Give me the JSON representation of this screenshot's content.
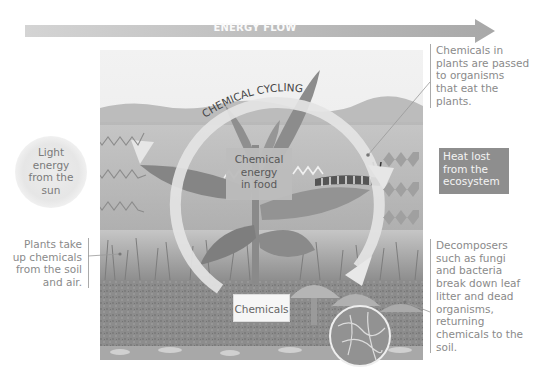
{
  "energy_flow": {
    "label": "ENERGY FLOW",
    "arrow_color": "#b8b8b8"
  },
  "chemical_cycling": {
    "label": "CHEMICAL CYCLING",
    "arrow_color": "#e2e2e2"
  },
  "sun": {
    "label_lines": [
      "Light",
      "energy",
      "from the",
      "sun"
    ],
    "label": "Light energy from the sun"
  },
  "boxes": {
    "chemical_energy": {
      "label_lines": [
        "Chemical",
        "energy",
        "in food"
      ],
      "label": "Chemical energy in food"
    },
    "chemicals": {
      "label": "Chemicals"
    },
    "heat_lost": {
      "label_lines": [
        "Heat lost",
        "from the",
        "ecosystem"
      ],
      "label": "Heat lost from the ecosystem",
      "color": "#8e8e8e"
    }
  },
  "annotations": {
    "plants_take_up": {
      "lines": [
        "Plants take",
        "up chemicals",
        "from the soil",
        "and air."
      ]
    },
    "chemicals_passed": {
      "lines": [
        "Chemicals in",
        "plants are passed",
        "to organisms",
        "that eat the",
        "plants."
      ]
    },
    "decomposers": {
      "lines": [
        "Decomposers",
        "such as fungi",
        "and bacteria",
        "break down leaf",
        "litter and dead",
        "organisms,",
        "returning",
        "chemicals to the",
        "soil."
      ]
    }
  },
  "icons": {
    "light_arrows": "zigzag-arrow-outline",
    "heat_arrows": "zigzag-arrow-filled",
    "caterpillar": "caterpillar",
    "mushrooms": "mushroom",
    "plant": "plant",
    "magnifier": "soil-magnifier-circle"
  }
}
